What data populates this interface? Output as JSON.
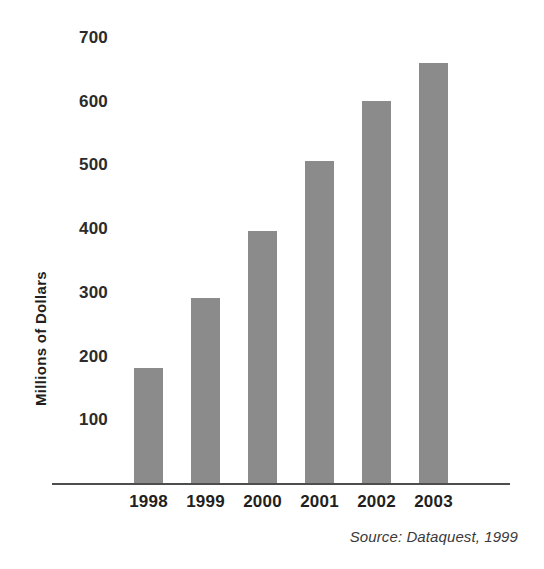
{
  "chart_data": {
    "type": "bar",
    "title": "",
    "subtitle": "",
    "xlabel": "",
    "ylabel": "Millions of Dollars",
    "categories": [
      "1998",
      "1999",
      "2000",
      "2001",
      "2002",
      "2003"
    ],
    "values": [
      180,
      290,
      395,
      505,
      600,
      660
    ],
    "series": [
      {
        "name": "Millions of Dollars",
        "values": [
          180,
          290,
          395,
          505,
          600,
          660
        ]
      }
    ],
    "ylim": [
      0,
      700
    ],
    "y_ticks": [
      700,
      600,
      500,
      400,
      300,
      200,
      100
    ],
    "y_tick_labels": [
      "700",
      "600",
      "500",
      "400",
      "300",
      "200",
      "100"
    ],
    "grid": false,
    "legend": false,
    "legend_position": "none",
    "bar_color": "#8b8b8b",
    "axis_color": "#4d4d4d",
    "text_color": "#231f20",
    "background_color": "#ffffff",
    "annotations": [
      "Source: Dataquest, 1999"
    ]
  },
  "source": {
    "note": "Source: Dataquest, 1999"
  }
}
